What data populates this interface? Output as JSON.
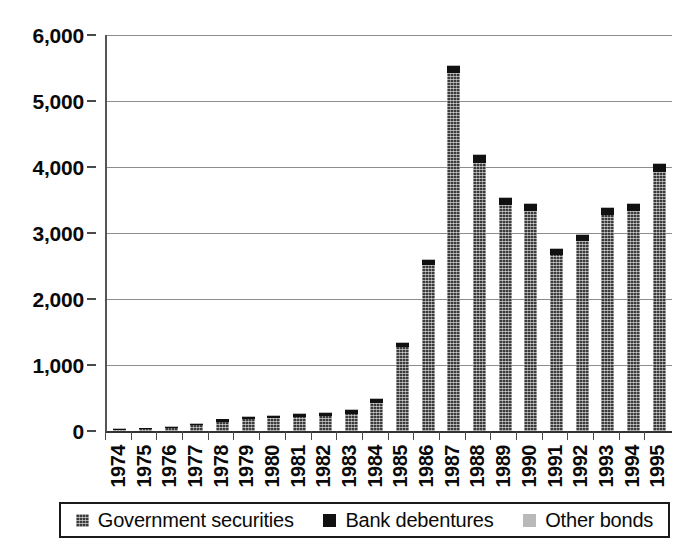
{
  "chart_data": {
    "type": "bar",
    "subtype": "stacked-column",
    "title": "",
    "subtitle": "",
    "xlabel": "",
    "ylabel": "",
    "ylim": [
      0,
      6000
    ],
    "ytick_values": [
      0,
      1000,
      2000,
      3000,
      4000,
      5000,
      6000
    ],
    "ytick_labels": [
      "0",
      "1,000",
      "2,000",
      "3,000",
      "4,000",
      "5,000",
      "6,000"
    ],
    "grid": true,
    "grid_axis": "y",
    "legend_position": "bottom",
    "categories": [
      "1974",
      "1975",
      "1976",
      "1977",
      "1978",
      "1979",
      "1980",
      "1981",
      "1982",
      "1983",
      "1984",
      "1985",
      "1986",
      "1987",
      "1988",
      "1989",
      "1990",
      "1991",
      "1992",
      "1993",
      "1994",
      "1995"
    ],
    "series": [
      {
        "name": "Government securities",
        "color": "#3b3b3b",
        "pattern": "dense-dotted",
        "values": [
          20,
          30,
          50,
          85,
          140,
          175,
          190,
          215,
          225,
          265,
          420,
          1270,
          2510,
          5430,
          4060,
          3430,
          3340,
          2670,
          2880,
          3280,
          3340,
          3930
        ]
      },
      {
        "name": "Bank debentures",
        "color": "#111111",
        "pattern": "solid",
        "values": [
          8,
          10,
          14,
          22,
          35,
          40,
          45,
          50,
          55,
          58,
          62,
          70,
          85,
          95,
          115,
          95,
          95,
          85,
          90,
          95,
          100,
          110
        ]
      },
      {
        "name": "Other bonds",
        "color": "#b9b9b9",
        "pattern": "solid",
        "values": [
          2,
          3,
          4,
          6,
          8,
          9,
          10,
          11,
          11,
          12,
          13,
          14,
          15,
          16,
          17,
          16,
          16,
          15,
          15,
          16,
          16,
          17
        ]
      }
    ],
    "totals": [
      30,
      43,
      68,
      113,
      183,
      224,
      245,
      276,
      291,
      335,
      495,
      1354,
      2610,
      5541,
      4192,
      3541,
      3451,
      2770,
      2985,
      3391,
      3456,
      4057
    ]
  },
  "axes": {
    "y": {
      "ticks": [
        {
          "label": "6,000",
          "value": 6000
        },
        {
          "label": "5,000",
          "value": 5000
        },
        {
          "label": "4,000",
          "value": 4000
        },
        {
          "label": "3,000",
          "value": 3000
        },
        {
          "label": "2,000",
          "value": 2000
        },
        {
          "label": "1,000",
          "value": 1000
        },
        {
          "label": "0",
          "value": 0
        }
      ]
    }
  },
  "legend": {
    "items": [
      {
        "label": "Government securities",
        "swatch": "gov-securities-swatch"
      },
      {
        "label": "Bank debentures",
        "swatch": "bank-debentures-swatch"
      },
      {
        "label": "Other bonds",
        "swatch": "other-bonds-swatch"
      }
    ]
  }
}
